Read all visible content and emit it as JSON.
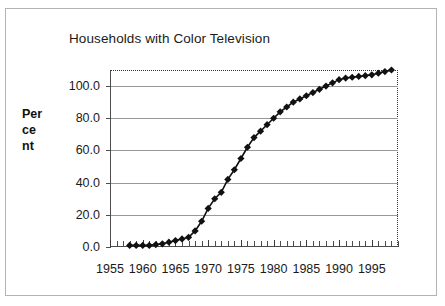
{
  "figure": {
    "title": "Households with Color Television",
    "y_axis_title_lines": [
      "Per",
      "ce",
      "nt"
    ],
    "background_color": "#ffffff",
    "series_color": "#111111",
    "gridline_color": "#999999",
    "axis_color": "#4d4d4d"
  },
  "chart_data": {
    "type": "line",
    "title": "Households with Color Television",
    "xlabel": "",
    "ylabel": "Percent",
    "xlim": [
      1955,
      1999
    ],
    "ylim": [
      0.0,
      110.0
    ],
    "grid": true,
    "legend": "none",
    "marker": "diamond",
    "ytick_labels": [
      "0.0",
      "20.0",
      "40.0",
      "60.0",
      "80.0",
      "100.0"
    ],
    "ytick_values": [
      0.0,
      20.0,
      40.0,
      60.0,
      80.0,
      100.0
    ],
    "xtick_labels": [
      "1955",
      "1960",
      "1965",
      "1970",
      "1975",
      "1980",
      "1985",
      "1990",
      "1995"
    ],
    "xtick_values": [
      1955,
      1960,
      1965,
      1970,
      1975,
      1980,
      1985,
      1990,
      1995
    ],
    "x": [
      1958,
      1959,
      1960,
      1961,
      1962,
      1963,
      1964,
      1965,
      1966,
      1967,
      1968,
      1969,
      1970,
      1971,
      1972,
      1973,
      1974,
      1975,
      1976,
      1977,
      1978,
      1979,
      1980,
      1981,
      1982,
      1983,
      1984,
      1985,
      1986,
      1987,
      1988,
      1989,
      1990,
      1991,
      1992,
      1993,
      1994,
      1995,
      1996,
      1997,
      1998
    ],
    "series": [
      {
        "name": "Households with color television",
        "values": [
          1.0,
          1.0,
          1.0,
          1.0,
          1.5,
          2.0,
          3.0,
          4.0,
          5.0,
          6.0,
          10.0,
          16.0,
          24.0,
          30.0,
          34.0,
          42.0,
          48.0,
          55.0,
          62.0,
          68.0,
          72.0,
          76.0,
          80.0,
          84.0,
          87.0,
          90.0,
          92.0,
          94.0,
          96.0,
          98.0,
          100.0,
          102.0,
          104.0,
          105.0,
          105.5,
          106.0,
          106.5,
          107.0,
          108.0,
          109.0,
          110.0
        ]
      }
    ]
  }
}
